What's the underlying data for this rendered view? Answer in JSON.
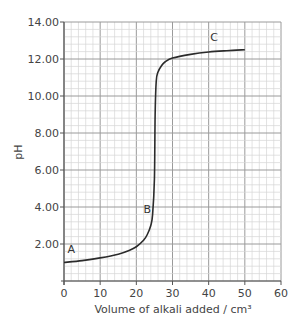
{
  "chart_data": {
    "type": "line",
    "title": "",
    "xlabel": "Volume of alkali added / cm³",
    "ylabel": "pH",
    "xlim": [
      0,
      60
    ],
    "ylim": [
      0,
      14
    ],
    "x_ticks": [
      "0",
      "10",
      "20",
      "30",
      "40",
      "50",
      "60"
    ],
    "y_ticks": [
      "2.00",
      "4.00",
      "6.00",
      "8.00",
      "10.00",
      "12.00",
      "14.00"
    ],
    "grid": true,
    "series": [
      {
        "name": "titration curve",
        "x": [
          0,
          5,
          10,
          15,
          18,
          20,
          22,
          23,
          24,
          24.5,
          25,
          25.2,
          25.5,
          26,
          27,
          28,
          30,
          35,
          40,
          45,
          50
        ],
        "y": [
          1.0,
          1.1,
          1.25,
          1.45,
          1.65,
          1.85,
          2.2,
          2.5,
          3.0,
          3.6,
          5.5,
          9.0,
          10.8,
          11.3,
          11.65,
          11.85,
          12.05,
          12.25,
          12.38,
          12.45,
          12.5
        ]
      }
    ],
    "annotations": [
      {
        "label": "A",
        "x": 2,
        "y": 1.5
      },
      {
        "label": "B",
        "x": 23,
        "y": 3.7
      },
      {
        "label": "C",
        "x": 41.5,
        "y": 13.0
      }
    ]
  },
  "colors": {
    "curve": "#2b2b2b",
    "major_grid": "#9a9a9a",
    "minor_grid": "#d6d6d6",
    "axis": "#555555"
  }
}
